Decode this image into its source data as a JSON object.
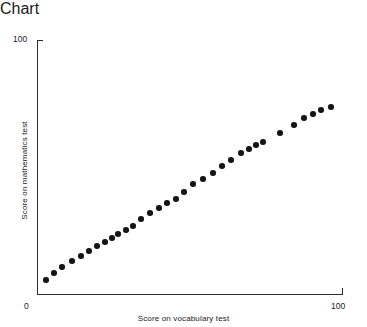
{
  "chart_data": {
    "type": "scatter",
    "title": "",
    "xlabel": "Score on vocabulary test",
    "ylabel": "Score on mathematics test",
    "xlim": [
      0,
      100
    ],
    "ylim": [
      0,
      100
    ],
    "grid": false,
    "legend": null,
    "x_tick_labels": [
      "0",
      "100"
    ],
    "y_tick_labels": [
      "0",
      "100"
    ],
    "marker": "filled-circle",
    "marker_color": "#151515",
    "points": [
      {
        "x": 3.0,
        "y": 5.5
      },
      {
        "x": 5.6,
        "y": 8.3
      },
      {
        "x": 8.2,
        "y": 10.6
      },
      {
        "x": 11.5,
        "y": 13.0
      },
      {
        "x": 14.4,
        "y": 15.0
      },
      {
        "x": 17.0,
        "y": 16.9
      },
      {
        "x": 19.7,
        "y": 18.9
      },
      {
        "x": 22.3,
        "y": 20.5
      },
      {
        "x": 24.6,
        "y": 22.0
      },
      {
        "x": 26.6,
        "y": 23.6
      },
      {
        "x": 29.2,
        "y": 25.2
      },
      {
        "x": 31.5,
        "y": 26.8
      },
      {
        "x": 34.1,
        "y": 29.5
      },
      {
        "x": 37.0,
        "y": 31.9
      },
      {
        "x": 40.0,
        "y": 33.9
      },
      {
        "x": 42.6,
        "y": 35.8
      },
      {
        "x": 45.6,
        "y": 37.4
      },
      {
        "x": 48.2,
        "y": 40.2
      },
      {
        "x": 51.1,
        "y": 43.3
      },
      {
        "x": 54.4,
        "y": 45.3
      },
      {
        "x": 57.7,
        "y": 47.6
      },
      {
        "x": 60.7,
        "y": 50.4
      },
      {
        "x": 63.6,
        "y": 52.8
      },
      {
        "x": 66.9,
        "y": 55.5
      },
      {
        "x": 69.5,
        "y": 57.1
      },
      {
        "x": 71.8,
        "y": 58.7
      },
      {
        "x": 74.1,
        "y": 59.8
      },
      {
        "x": 79.7,
        "y": 63.4
      },
      {
        "x": 84.3,
        "y": 66.5
      },
      {
        "x": 87.5,
        "y": 69.3
      },
      {
        "x": 90.5,
        "y": 70.9
      },
      {
        "x": 93.1,
        "y": 72.4
      },
      {
        "x": 96.4,
        "y": 73.6
      }
    ]
  },
  "labels": {
    "y_max": "100",
    "origin": "0",
    "x_max": "100",
    "x_title": "Score on vocabulary test",
    "y_title": "Score on mathematics test"
  }
}
